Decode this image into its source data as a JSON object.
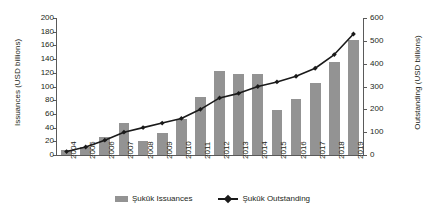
{
  "chart_data": {
    "type": "bar",
    "title": "",
    "xlabel": "",
    "categories": [
      "2004",
      "2005",
      "2006",
      "2007",
      "2008",
      "2009",
      "2010",
      "2011",
      "2012",
      "2013",
      "2014",
      "2015",
      "2016",
      "2017",
      "2018",
      "2019"
    ],
    "series": [
      {
        "name": "Şukūk Issuances",
        "type": "bar",
        "axis": "left",
        "color": "#939393",
        "values": [
          7,
          12,
          27,
          47,
          20,
          32,
          52,
          85,
          123,
          118,
          118,
          65,
          82,
          105,
          136,
          168
        ]
      },
      {
        "name": "Şukūk Outstanding",
        "type": "line",
        "axis": "right",
        "color": "#1a1a1a",
        "values": [
          15,
          35,
          65,
          100,
          120,
          140,
          160,
          200,
          250,
          270,
          300,
          320,
          345,
          380,
          440,
          530
        ]
      }
    ],
    "axes": {
      "left": {
        "label": "Issuances (USD billions)",
        "ylim": [
          0,
          200
        ],
        "ticks": [
          0,
          20,
          40,
          60,
          80,
          100,
          120,
          140,
          160,
          180,
          200
        ]
      },
      "right": {
        "label": "Outstanding (USD billions)",
        "ylim": [
          0,
          600
        ],
        "ticks": [
          0,
          100,
          200,
          300,
          400,
          500,
          600
        ]
      }
    },
    "grid": false,
    "legend": {
      "position": "bottom",
      "entries": [
        {
          "label": "Şukūk Issuances",
          "marker": "bar-swatch",
          "color": "#939393"
        },
        {
          "label": "Şukūk Outstanding",
          "marker": "line-diamond",
          "color": "#1a1a1a"
        }
      ]
    }
  }
}
